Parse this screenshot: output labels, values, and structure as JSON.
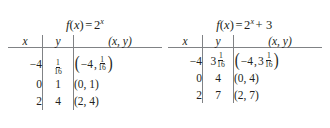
{
  "figure": {
    "background_color": "#ffffff",
    "text_color": "#231f20",
    "rule_color": "#808285"
  },
  "tables": [
    {
      "title_parts": {
        "fn": "f",
        "open": "(",
        "var": "x",
        "close": ")",
        "equals": "=",
        "base": "2",
        "exponent": "x",
        "extra": ""
      },
      "title_text": "f(x) = 2^x",
      "headers": [
        "x",
        "y",
        "(x, y)"
      ],
      "rows": [
        {
          "x": "−4",
          "y_whole": "",
          "y_num": "1",
          "y_den": "16",
          "y_text": "1/16",
          "pair_x": "−4",
          "pair_y_whole": "",
          "pair_y_num": "1",
          "pair_y_den": "16",
          "pair_text": "(−4, 1/16)",
          "tall_parens": true
        },
        {
          "x": "0",
          "y_text": "1",
          "pair_text": "(0, 1)",
          "tall_parens": false
        },
        {
          "x": "2",
          "y_text": "4",
          "pair_text": "(2, 4)",
          "tall_parens": false
        }
      ]
    },
    {
      "title_parts": {
        "fn": "f",
        "open": "(",
        "var": "x",
        "close": ")",
        "equals": "=",
        "base": "2",
        "exponent": "x",
        "extra": "+ 3"
      },
      "title_text": "f(x) = 2^x + 3",
      "headers": [
        "x",
        "y",
        "(x, y)"
      ],
      "rows": [
        {
          "x": "−4",
          "y_whole": "3",
          "y_num": "1",
          "y_den": "16",
          "y_text": "3 1/16",
          "pair_x": "−4",
          "pair_y_whole": "3",
          "pair_y_num": "1",
          "pair_y_den": "16",
          "pair_text": "(−4, 3 1/16)",
          "tall_parens": true
        },
        {
          "x": "0",
          "y_text": "4",
          "pair_text": "(0, 4)",
          "tall_parens": false
        },
        {
          "x": "2",
          "y_text": "7",
          "pair_text": "(2, 7)",
          "tall_parens": false
        }
      ]
    }
  ]
}
